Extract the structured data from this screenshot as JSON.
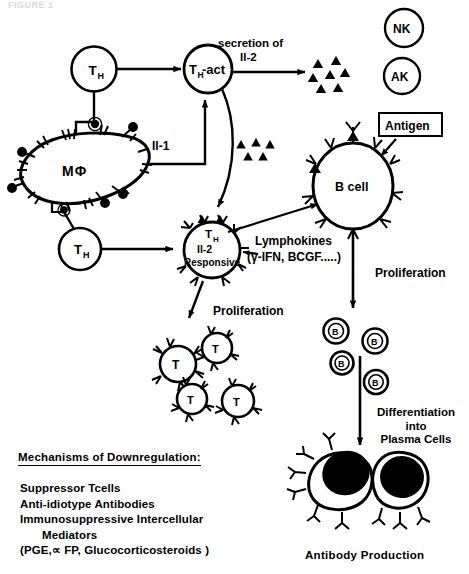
{
  "figure": {
    "top_cut_caption": "FIGURE 1",
    "domain": "immunology-cell-signaling-diagram"
  },
  "cells": {
    "th_top": {
      "label": "T",
      "sub": "H",
      "name": "helper-t-cell"
    },
    "th_act": {
      "label": "T",
      "sub": "H",
      "suffix": "-act",
      "name": "activated-helper-t-cell"
    },
    "macrophage": {
      "label": "MΦ",
      "name": "macrophage"
    },
    "th_bottom": {
      "label": "T",
      "sub": "H",
      "name": "helper-t-cell-2"
    },
    "th_responsive": {
      "line1": "T",
      "line1_sub": "H",
      "line2": "Il-2",
      "line3": "Responsive"
    },
    "b_cell": {
      "label": "B cell"
    },
    "nk": {
      "label": "NK"
    },
    "ak": {
      "label": "AK"
    },
    "t_clones": [
      "T",
      "T",
      "T",
      "T"
    ],
    "b_clones": [
      "B",
      "B",
      "B",
      "B"
    ]
  },
  "labels": {
    "secretion_line1": "secretion of",
    "secretion_line2": "Il-2",
    "il1": "Il-1",
    "antigen": "Antigen",
    "lymphokines_line1": "Lymphokines",
    "lymphokines_line2": "(γ-IFN, BCGF.....)",
    "proliferation_left": "Proliferation",
    "proliferation_right": "Proliferation",
    "differentiation_line1": "Differentiation",
    "differentiation_line2": "into",
    "differentiation_line3": "Plasma Cells",
    "antibody_production": "Antibody Production"
  },
  "downregulation": {
    "title": "Mechanisms of  Downregulation:",
    "items": [
      "Suppressor Tcells",
      "Anti-idiotype Antibodies",
      "Immunosuppressive  Intercellular",
      "Mediators",
      "(PGE,∝ FP, Glucocorticosteroids )"
    ]
  },
  "colors": {
    "ink": "#000000",
    "paper": "#ffffff",
    "ghost": "#d9d9d9"
  }
}
